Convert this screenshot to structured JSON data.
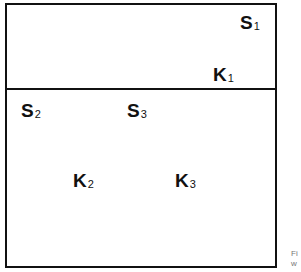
{
  "diagram": {
    "upper_region": {
      "labels": [
        {
          "letter": "S",
          "sub": "1"
        },
        {
          "letter": "K",
          "sub": "1"
        }
      ]
    },
    "lower_region": {
      "labels": [
        {
          "letter": "S",
          "sub": "2"
        },
        {
          "letter": "S",
          "sub": "3"
        },
        {
          "letter": "K",
          "sub": "2"
        },
        {
          "letter": "K",
          "sub": "3"
        }
      ]
    },
    "caption_fragment": [
      "Fi",
      "w"
    ]
  }
}
